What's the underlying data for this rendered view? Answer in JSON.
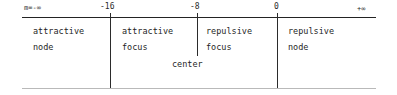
{
  "diagram": {
    "axis": {
      "variable_label": "m=-∞",
      "end_label": "+∞",
      "ticks": [
        {
          "label": "-16",
          "x": 110
        },
        {
          "label": "-8",
          "x": 197
        },
        {
          "label": "0",
          "x": 277
        }
      ]
    },
    "regions": [
      {
        "name": "attractive-node",
        "line1": "attractive",
        "line2": "node"
      },
      {
        "name": "attractive-focus",
        "line1": "attractive",
        "line2": "focus"
      },
      {
        "name": "repulsive-focus",
        "line1": "repulsive",
        "line2": "focus"
      },
      {
        "name": "repulsive-node",
        "line1": "repulsive",
        "line2": "node"
      }
    ],
    "center_label": "center"
  },
  "colors": {
    "ink": "#1f1f1f",
    "rule": "#232323",
    "rule_faint": "#b9b9b9",
    "background": "#ffffff"
  }
}
